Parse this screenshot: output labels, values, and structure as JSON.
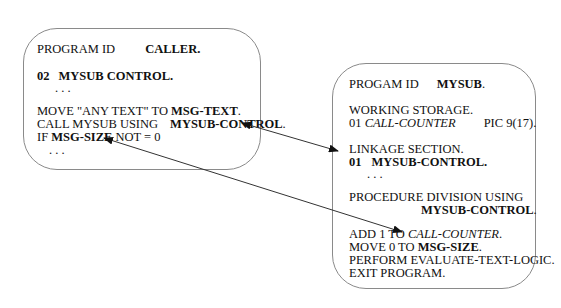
{
  "caller": {
    "program_id_label": "PROGRAM ID",
    "program_id_value": "CALLER.",
    "level": "02",
    "record": "MYSUB CONTROL.",
    "ellipsis1": ". . .",
    "move_stmt": "MOVE \"ANY TEXT\" TO ",
    "move_target": "MSG-TEXT",
    "move_end": ".",
    "call_stmt": "CALL MYSUB USING",
    "call_target": "MYSUB-CONTROL",
    "call_end": ".",
    "if_kw": "IF ",
    "if_field": "MSG-SIZE",
    "if_rest": " NOT = 0",
    "ellipsis2": ". . ."
  },
  "mysub": {
    "program_id_label": "PROGAM ID",
    "program_id_value": "MYSUB",
    "program_id_end": ".",
    "working_storage": "WORKING STORAGE.",
    "ws_level": "01 ",
    "ws_field": "CALL-COUNTER",
    "ws_pic": "PIC 9(17).",
    "linkage": "LINKAGE SECTION.",
    "lk_level": "01",
    "lk_record": "MYSUB-CONTROL.",
    "ellipsis": ". . .",
    "procedure": "PROCEDURE DIVISION USING",
    "procedure_target": "MYSUB-CONTROL",
    "procedure_end": ".",
    "add_stmt": "ADD 1 TO ",
    "add_target": "CALL-COUNTER",
    "add_end": ".",
    "move_stmt": "MOVE 0 TO ",
    "move_target": "MSG-SIZE",
    "move_end": ".",
    "perform": "PERFORM EVALUATE-TEXT-LOGIC.",
    "exit": "EXIT PROGRAM."
  },
  "arrows": [
    {
      "name": "call-to-linkage",
      "from": "MYSUB-CONTROL (caller)",
      "to": "MYSUB-CONTROL (linkage)",
      "bidirectional": true
    },
    {
      "name": "msg-size-link",
      "from": "MSG-SIZE (mysub)",
      "to": "MSG-SIZE (caller)",
      "bidirectional": true
    }
  ]
}
